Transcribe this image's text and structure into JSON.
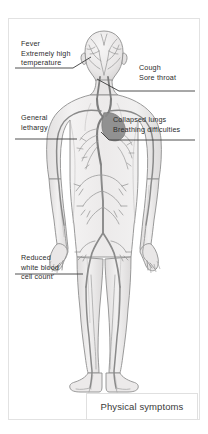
{
  "diagram": {
    "title": "Physical symptoms",
    "annotations": [
      {
        "id": "fever",
        "name": "annotation-fever",
        "lines": [
          "Fever",
          "Extremely high",
          "temperature"
        ],
        "points_to": "head"
      },
      {
        "id": "cough",
        "name": "annotation-cough",
        "lines": [
          "Cough",
          "Sore throat"
        ],
        "points_to": "throat"
      },
      {
        "id": "lethargy",
        "name": "annotation-general-lethargy",
        "lines": [
          "General",
          "lethargy"
        ],
        "points_to": "left-arm"
      },
      {
        "id": "lungs",
        "name": "annotation-collapsed-lungs",
        "lines": [
          "Collapsed lungs",
          "Breathing difficulties"
        ],
        "points_to": "chest"
      },
      {
        "id": "wbc",
        "name": "annotation-reduced-white-blood-cell-count",
        "lines": [
          "Reduced",
          "white blood",
          "cell count'"
        ],
        "points_to": "left-leg"
      }
    ],
    "colors": {
      "frame_border": "#e2e2e2",
      "text": "#2c2c2c",
      "caption_text": "#3a3a3a",
      "leader_line": "#3c3c3c",
      "body_outline": "#8e8e8e",
      "body_fill": "#eceaea",
      "vessel_dark": "#7d7d7d",
      "vessel_light": "#b4b4b4",
      "background": "#ffffff"
    }
  }
}
